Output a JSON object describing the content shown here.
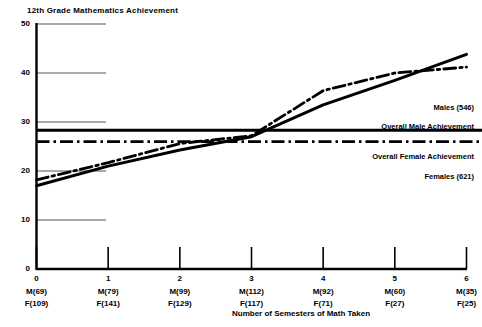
{
  "chart_data": {
    "type": "line",
    "title": "12th Grade Mathematics Achievement",
    "xlabel": "Number of Semesters of Math Taken",
    "ylabel": "",
    "xlim": [
      0,
      6
    ],
    "ylim": [
      0,
      50
    ],
    "grid": "partial-horizontal",
    "legend_position": "right-inline",
    "x": [
      0,
      1,
      2,
      3,
      4,
      5,
      6
    ],
    "xticks": [
      "0",
      "1",
      "2",
      "3",
      "4",
      "5",
      "6"
    ],
    "yticks": [
      "0",
      "10",
      "20",
      "30",
      "40",
      "50"
    ],
    "ytick_values": [
      0,
      10,
      20,
      30,
      40,
      50
    ],
    "series": [
      {
        "name": "Males (546)",
        "style": "solid",
        "values": [
          17.0,
          21.0,
          24.3,
          27.0,
          33.5,
          38.5,
          43.8
        ]
      },
      {
        "name": "Females (621)",
        "style": "dash-dot",
        "values": [
          18.2,
          21.7,
          25.6,
          27.2,
          36.4,
          40.0,
          41.2
        ]
      }
    ],
    "reference_lines": [
      {
        "name": "Overall Male Achievement",
        "style": "solid",
        "value": 28.3
      },
      {
        "name": "Overall Female Achievement",
        "style": "dash-dot",
        "value": 26.0
      }
    ],
    "x_sub_labels": [
      {
        "male": "M(69)",
        "female": "F(109)"
      },
      {
        "male": "M(79)",
        "female": "F(141)"
      },
      {
        "male": "M(99)",
        "female": "F(129)"
      },
      {
        "male": "M(112)",
        "female": "F(117)"
      },
      {
        "male": "M(92)",
        "female": "F(71)"
      },
      {
        "male": "M(60)",
        "female": "F(27)"
      },
      {
        "male": "M(35)",
        "female": "F(25)"
      }
    ],
    "annotations": [
      {
        "key": "males_label",
        "text": "Males (546)"
      },
      {
        "key": "overall_male_label",
        "text": "Overall Male Achievement"
      },
      {
        "key": "overall_female_label",
        "text": "Overall Female Achievement"
      },
      {
        "key": "females_label",
        "text": "Females (621)"
      }
    ],
    "colors": {
      "line": "#000000",
      "axis": "#000000",
      "grid": "#555555",
      "background": "#ffffff"
    }
  }
}
